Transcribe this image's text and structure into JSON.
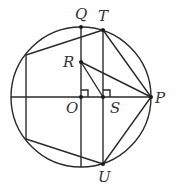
{
  "diagram": {
    "type": "geometry",
    "circle": {
      "center": "O",
      "cx": 81,
      "cy": 97,
      "r": 70
    },
    "points": {
      "O": {
        "x": 81,
        "y": 97,
        "label": "O"
      },
      "S": {
        "x": 103,
        "y": 97,
        "label": "S"
      },
      "P": {
        "x": 151,
        "y": 97,
        "label": "P"
      },
      "Q": {
        "x": 81,
        "y": 27,
        "label": "Q"
      },
      "T": {
        "x": 103,
        "y": 30,
        "label": "T"
      },
      "U": {
        "x": 103,
        "y": 164,
        "label": "U"
      },
      "R": {
        "x": 81,
        "y": 62,
        "label": "R"
      }
    },
    "labels": {
      "Q": "Q",
      "T": "T",
      "R": "R",
      "O": "O",
      "S": "S",
      "P": "P",
      "U": "U"
    },
    "segments": [
      "Q-O-bottom",
      "T-U",
      "diameter-horizontal",
      "R-P",
      "R-S",
      "T-P",
      "U-P",
      "left-chord",
      "left-top-to-T",
      "left-bottom-to-U"
    ],
    "right_angle_marks": [
      "at O",
      "at S"
    ]
  }
}
